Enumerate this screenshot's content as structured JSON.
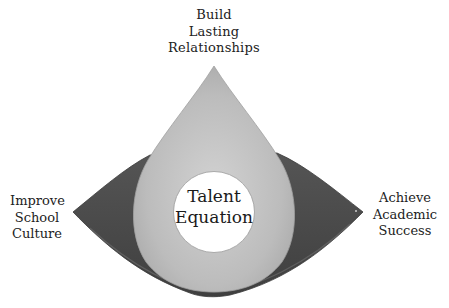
{
  "diagram": {
    "title": "Talent Equation",
    "center": {
      "lines": [
        "Talent",
        "Equation"
      ]
    },
    "nodes": {
      "top": {
        "lines": [
          "Build",
          "Lasting",
          "Relationships"
        ]
      },
      "left": {
        "lines": [
          "Improve",
          "School",
          "Culture"
        ]
      },
      "right": {
        "lines": [
          "Achieve",
          "Academic",
          "Success"
        ]
      }
    },
    "colors": {
      "background": "#ffffff",
      "eye_shape": "#4a4a4a",
      "eye_shape_edge": "#3a3a3a",
      "drop_shape": "#b9b9b9",
      "drop_highlight": "#cfcfcf",
      "center_circle": "#ffffff",
      "text": "#222222"
    }
  }
}
